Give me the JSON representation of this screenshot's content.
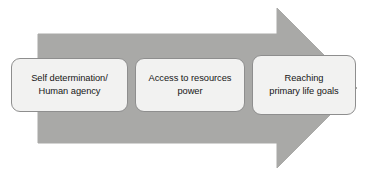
{
  "diagram": {
    "type": "process-arrow",
    "title": "",
    "direction": "left-to-right",
    "arrow": {
      "name": "right-pointing-block-arrow",
      "fill_color": "#a9a9a7",
      "stroke_color": "#a9a9a7"
    },
    "box_style": {
      "fill_color": "#f2f2f1",
      "border_color": "#8e8e8e",
      "text_color": "#161616"
    },
    "steps": [
      {
        "id": "step-1",
        "line_1": "Self determination/",
        "line_2": "Human agency"
      },
      {
        "id": "step-2",
        "line_1": "Access to resources",
        "line_2": "power"
      },
      {
        "id": "step-3",
        "line_1": "Reaching",
        "line_2": "primary life goals"
      }
    ]
  }
}
